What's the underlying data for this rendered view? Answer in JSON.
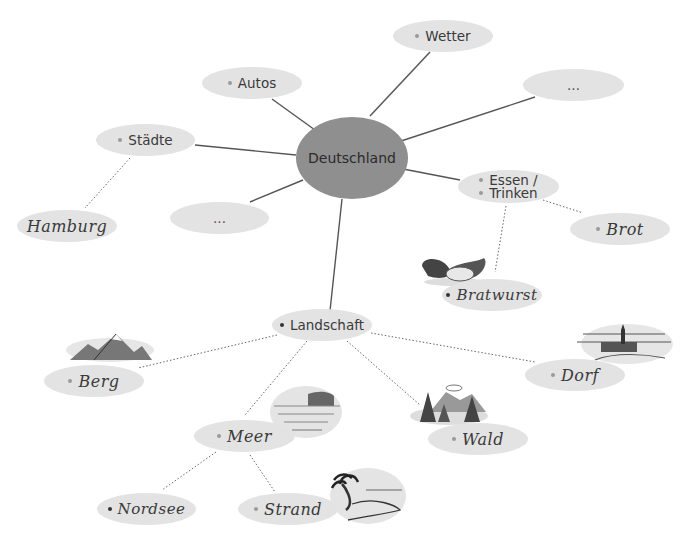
{
  "diagram": {
    "type": "mind-map",
    "center": {
      "id": "deutschland",
      "label": "Deutschland"
    },
    "colors": {
      "center_fill": "#8f8f8f",
      "node_fill": "#e3e3e3",
      "line": "#555555",
      "background": "#ffffff"
    },
    "nodes": {
      "wetter": {
        "label": "Wetter",
        "bullet": true,
        "style": "print"
      },
      "autos": {
        "label": "Autos",
        "bullet": true,
        "style": "print"
      },
      "empty_right": {
        "label": "...",
        "bullet": false,
        "style": "print"
      },
      "staedte": {
        "label": "Städte",
        "bullet": true,
        "style": "print"
      },
      "essen_trinken": {
        "line1": "Essen /",
        "line2": "Trinken",
        "bullet": true,
        "style": "print"
      },
      "empty_left": {
        "label": "...",
        "bullet": false,
        "style": "print"
      },
      "hamburg": {
        "label": "Hamburg",
        "bullet": false,
        "style": "handwritten"
      },
      "brot": {
        "label": "Brot",
        "bullet": true,
        "style": "handwritten"
      },
      "bratwurst": {
        "label": "Bratwurst",
        "bullet": true,
        "style": "handwritten"
      },
      "landschaft": {
        "label": "Landschaft",
        "bullet": true,
        "style": "print"
      },
      "berg": {
        "label": "Berg",
        "bullet": true,
        "style": "handwritten"
      },
      "dorf": {
        "label": "Dorf",
        "bullet": true,
        "style": "handwritten"
      },
      "wald": {
        "label": "Wald",
        "bullet": true,
        "style": "handwritten"
      },
      "meer": {
        "label": "Meer",
        "bullet": true,
        "style": "handwritten"
      },
      "nordsee": {
        "label": "Nordsee",
        "bullet": true,
        "style": "handwritten"
      },
      "strand": {
        "label": "Strand",
        "bullet": true,
        "style": "handwritten"
      }
    },
    "edges": [
      {
        "from": "Deutschland",
        "to": "Wetter",
        "style": "solid"
      },
      {
        "from": "Deutschland",
        "to": "Autos",
        "style": "solid"
      },
      {
        "from": "Deutschland",
        "to": "...",
        "style": "solid"
      },
      {
        "from": "Deutschland",
        "to": "Städte",
        "style": "solid"
      },
      {
        "from": "Deutschland",
        "to": "Essen / Trinken",
        "style": "solid"
      },
      {
        "from": "Deutschland",
        "to": "...",
        "style": "solid"
      },
      {
        "from": "Deutschland",
        "to": "Landschaft",
        "style": "solid"
      },
      {
        "from": "Städte",
        "to": "Hamburg",
        "style": "dotted"
      },
      {
        "from": "Essen / Trinken",
        "to": "Brot",
        "style": "dotted"
      },
      {
        "from": "Essen / Trinken",
        "to": "Bratwurst",
        "style": "dotted"
      },
      {
        "from": "Landschaft",
        "to": "Berg",
        "style": "dotted"
      },
      {
        "from": "Landschaft",
        "to": "Dorf",
        "style": "dotted"
      },
      {
        "from": "Landschaft",
        "to": "Wald",
        "style": "dotted"
      },
      {
        "from": "Landschaft",
        "to": "Meer",
        "style": "dotted"
      },
      {
        "from": "Meer",
        "to": "Nordsee",
        "style": "dotted"
      },
      {
        "from": "Meer",
        "to": "Strand",
        "style": "dotted"
      }
    ],
    "illustrations": [
      "sausage",
      "mountain",
      "village",
      "forest",
      "sea",
      "beach-palm"
    ]
  }
}
